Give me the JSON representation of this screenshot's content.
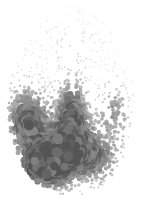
{
  "figure": {
    "width_px": 145,
    "height_px": 204,
    "background_color": "#ffffff",
    "has_visible_text": false,
    "has_axes": false,
    "has_legend": false
  },
  "chart_data": {
    "type": "scatter",
    "title": "",
    "subtitle": "",
    "xlabel": "",
    "ylabel": "",
    "xlim": [
      0,
      145
    ],
    "ylim": [
      0,
      204
    ],
    "grid": false,
    "legend": null,
    "annotations": [],
    "axes_visible": false,
    "tick_labels": {
      "x": [],
      "y": []
    },
    "colormap": "grayscale",
    "color_min": "#f0f0f0",
    "color_max": "#555555",
    "marker": "circle",
    "marker_size_range_px": [
      0.6,
      4.6
    ],
    "point_count": 1600,
    "silhouette": {
      "shape": "brain-axial-oval",
      "center_x": 72,
      "center_y": 101,
      "radius_x": 65,
      "radius_y": 95
    },
    "midline_gap": {
      "x": 73,
      "half_width_px": 3.2,
      "y_from": 6,
      "y_to": 96
    },
    "density_hotspots": [
      {
        "name": "inferior-central-core",
        "cx": 68,
        "cy": 148,
        "rx": 34,
        "ry": 36,
        "weight": 1.0
      },
      {
        "name": "left-lateral-band",
        "cx": 26,
        "cy": 120,
        "rx": 22,
        "ry": 36,
        "weight": 0.78
      },
      {
        "name": "left-posterior-arc",
        "cx": 42,
        "cy": 168,
        "rx": 26,
        "ry": 22,
        "weight": 0.74
      },
      {
        "name": "mid-central-stripe",
        "cx": 72,
        "cy": 104,
        "rx": 15,
        "ry": 30,
        "weight": 0.62
      },
      {
        "name": "right-lateral-band",
        "cx": 115,
        "cy": 112,
        "rx": 16,
        "ry": 30,
        "weight": 0.45
      },
      {
        "name": "right-posterior",
        "cx": 100,
        "cy": 160,
        "rx": 20,
        "ry": 22,
        "weight": 0.4
      },
      {
        "name": "superior-frontal-sparse",
        "cx": 72,
        "cy": 45,
        "rx": 46,
        "ry": 34,
        "weight": 0.1
      }
    ],
    "series": [
      {
        "name": "dot density",
        "values": [
          {
            "region": "superior-frontal",
            "density": 0.1,
            "mean_radius_px": 0.9,
            "mean_gray": "#cfcfcf"
          },
          {
            "region": "mid-central-stripe",
            "density": 0.62,
            "mean_radius_px": 2.4,
            "mean_gray": "#8c8c8c"
          },
          {
            "region": "left-lateral-band",
            "density": 0.78,
            "mean_radius_px": 2.7,
            "mean_gray": "#7d7d7d"
          },
          {
            "region": "right-lateral-band",
            "density": 0.45,
            "mean_radius_px": 1.9,
            "mean_gray": "#9e9e9e"
          },
          {
            "region": "inferior-central-core",
            "density": 1.0,
            "mean_radius_px": 3.4,
            "mean_gray": "#6a6a6a"
          },
          {
            "region": "left-posterior-arc",
            "density": 0.74,
            "mean_radius_px": 2.9,
            "mean_gray": "#787878"
          },
          {
            "region": "right-posterior",
            "density": 0.4,
            "mean_radius_px": 1.8,
            "mean_gray": "#a2a2a2"
          }
        ]
      }
    ]
  }
}
